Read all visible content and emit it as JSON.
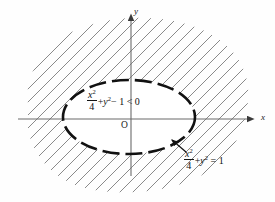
{
  "figure": {
    "background_color": "#fefefe",
    "axes": {
      "x_label": "x",
      "y_label": "y",
      "origin_label": "O",
      "axis_color": "#6b6b6b",
      "x_axis": {
        "y": 119,
        "x_start": 18,
        "x_end": 250,
        "arrow": "right"
      },
      "y_axis": {
        "x": 131,
        "y_start": 18,
        "y_end": 176,
        "arrow": "up"
      }
    },
    "curve": {
      "name": "ellipse",
      "style": "dashed",
      "color": "#111111",
      "stroke_width": 2.6,
      "center_x": 129,
      "center_y": 117,
      "radius_x": 66,
      "radius_y": 37,
      "equation_label": {
        "numerator": "x",
        "numerator_exp": "2",
        "denominator": "4",
        "plus": "+",
        "y_term": "y",
        "y_exp": "2",
        "relation": "= 1"
      }
    },
    "inequality_label": {
      "numerator": "x",
      "numerator_exp": "2",
      "denominator": "4",
      "plus": "+",
      "y_term": "y",
      "y_exp": "2",
      "minus_one": "− 1",
      "relation": "< 0"
    },
    "hatching": {
      "description": "diagonal hatch lines filling exterior of ellipse inside a rounded blob boundary",
      "angle_degrees": 45,
      "spacing_px": 9,
      "color": "#8a8a8a",
      "stroke_width": 1
    },
    "leader_line": {
      "description": "arrow from equation label up-left to ellipse boundary",
      "color": "#111111"
    }
  }
}
